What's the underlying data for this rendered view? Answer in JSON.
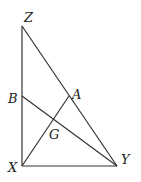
{
  "diagram": {
    "type": "geometry-triangle",
    "points": {
      "Z": {
        "label": "Z",
        "x": 22,
        "y": 26
      },
      "X": {
        "label": "X",
        "x": 22,
        "y": 166
      },
      "Y": {
        "label": "Y",
        "x": 117,
        "y": 166
      },
      "A": {
        "label": "A",
        "x": 69,
        "y": 96
      },
      "B": {
        "label": "B",
        "x": 22,
        "y": 96
      },
      "G": {
        "label": "G",
        "x": 53,
        "y": 119
      }
    },
    "segments": [
      [
        "Z",
        "X"
      ],
      [
        "X",
        "Y"
      ],
      [
        "Z",
        "Y"
      ],
      [
        "X",
        "A"
      ],
      [
        "B",
        "Y"
      ]
    ]
  }
}
